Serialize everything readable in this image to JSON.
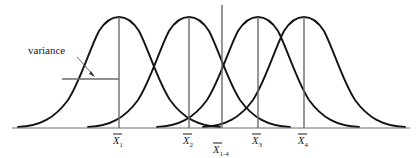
{
  "figure": {
    "type": "statistical-diagram",
    "background_color": "#ffffff",
    "curve_color": "#141414",
    "axis_color": "#6f6f6f",
    "guide_color": "#6a6a6a"
  },
  "annotation": {
    "variance_label": "variance",
    "leader_from_x": 78,
    "leader_from_y": 57,
    "leader_to_x": 95,
    "leader_to_y": 77,
    "bar_x1": 62,
    "bar_x2": 119,
    "bar_y": 79
  },
  "axis": {
    "x_start": 12,
    "x_end": 410,
    "y": 128
  },
  "ticks": [
    {
      "id": "x1",
      "base": "X",
      "sub": "1",
      "x": 119,
      "label_y": 143,
      "has_overbar": true,
      "drop_top": 17
    },
    {
      "id": "x2",
      "base": "X",
      "sub": "2",
      "x": 189,
      "label_y": 143,
      "has_overbar": true,
      "drop_top": 17
    },
    {
      "id": "x1_4",
      "base": "X",
      "sub": "1-4",
      "x": 222,
      "label_y": 152,
      "has_overbar": true,
      "drop_top": 5
    },
    {
      "id": "x3",
      "base": "X",
      "sub": "3",
      "x": 258,
      "label_y": 143,
      "has_overbar": true,
      "drop_top": 17
    },
    {
      "id": "x4",
      "base": "X",
      "sub": "4",
      "x": 304,
      "label_y": 143,
      "has_overbar": true,
      "drop_top": 17
    }
  ],
  "chart_data": {
    "type": "line",
    "title": "",
    "xlabel": "",
    "ylabel": "",
    "grid": false,
    "legend": "none",
    "xlim": [
      12,
      410
    ],
    "ylim": [
      0,
      1
    ],
    "distribution": "normal",
    "series": [
      {
        "name": "Curve 1",
        "mean_px": 119,
        "sigma_px": 42,
        "peak_y_px": 17,
        "mean_label": "X̄1"
      },
      {
        "name": "Curve 2",
        "mean_px": 189,
        "sigma_px": 42,
        "peak_y_px": 17,
        "mean_label": "X̄2"
      },
      {
        "name": "Curve 3",
        "mean_px": 258,
        "sigma_px": 42,
        "peak_y_px": 17,
        "mean_label": "X̄3"
      },
      {
        "name": "Curve 4",
        "mean_px": 304,
        "sigma_px": 42,
        "peak_y_px": 17,
        "mean_label": "X̄4"
      }
    ],
    "grand_mean_px": 222,
    "grand_mean_label": "X̄1-4",
    "annotations": [
      "variance"
    ]
  },
  "caption": {
    "clipped_text": ""
  }
}
